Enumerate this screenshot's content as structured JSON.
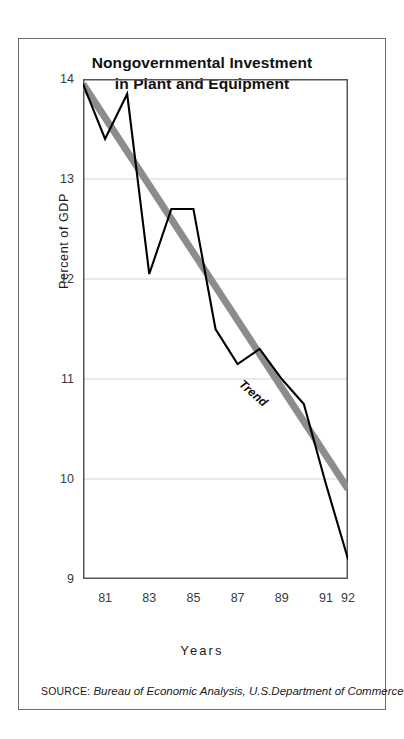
{
  "figure": {
    "title_line1": "Nongovernmental Investment",
    "title_line2": "in Plant and Equipment",
    "source_prefix": "SOURCE:",
    "source_text": " Bureau of Economic Analysis, U.S.Department of Commerce",
    "border_color": "#6e6e6e",
    "background": "#ffffff"
  },
  "chart_data": {
    "type": "line",
    "title": "Nongovernmental Investment in Plant and Equipment",
    "xlabel": "Years",
    "ylabel": "Percent of GDP",
    "xlim": [
      1980,
      1992
    ],
    "ylim": [
      9,
      14
    ],
    "grid": true,
    "legend": "none",
    "y_ticks": [
      14,
      13,
      12,
      11,
      10,
      9
    ],
    "y_tick_labels": [
      "14",
      "13",
      "12",
      "11",
      "10",
      "9"
    ],
    "x_ticks": [
      1981,
      1983,
      1985,
      1987,
      1989,
      1991,
      1992
    ],
    "x_tick_labels": [
      "81",
      "83",
      "85",
      "87",
      "89",
      "91",
      "92"
    ],
    "x": [
      1980,
      1981,
      1982,
      1983,
      1984,
      1985,
      1986,
      1987,
      1988,
      1989,
      1990,
      1991,
      1992
    ],
    "series": [
      {
        "name": "Nongovernmental investment",
        "style": "solid-black",
        "color": "#000000",
        "values": [
          13.95,
          13.4,
          13.85,
          12.05,
          12.7,
          12.7,
          11.5,
          11.15,
          11.3,
          11.0,
          10.75,
          9.95,
          9.2
        ]
      },
      {
        "name": "Trend",
        "style": "thick-gray",
        "color": "#8c8c8c",
        "annotation": "Trend",
        "x": [
          1980,
          1992
        ],
        "values": [
          13.95,
          9.9
        ]
      }
    ],
    "annotations": [
      {
        "text": "Trend",
        "x": 1988.1,
        "y": 10.95,
        "rotation": 41
      }
    ]
  },
  "axis": {
    "x_title": "Years",
    "y_title": "Percent of GDP"
  },
  "colors": {
    "data_line": "#000000",
    "trend_line": "#8c8c8c",
    "gridline": "#d3d3d3",
    "axis": "#555555",
    "tick_text": "#3a3a3a"
  }
}
